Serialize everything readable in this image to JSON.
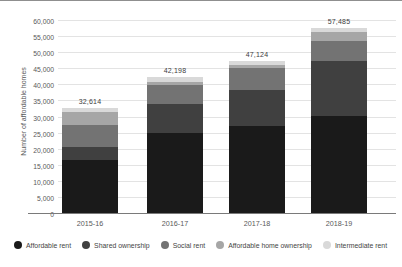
{
  "chart_data": {
    "type": "bar",
    "stacked": true,
    "title": "",
    "ylabel": "Number of affordable homes",
    "xlabel": "",
    "ylim": [
      0,
      60000
    ],
    "ytick_step": 5000,
    "ytick_labels": [
      "0",
      "5,000",
      "10,000",
      "15,000",
      "20,000",
      "25,000",
      "30,000",
      "35,000",
      "40,000",
      "45,000",
      "50,000",
      "55,000",
      "60,000"
    ],
    "grid": true,
    "legend_position": "bottom",
    "categories": [
      "2015-16",
      "2016-17",
      "2017-18",
      "2018-19"
    ],
    "series": [
      {
        "name": "Affordable rent",
        "color": "#1a1a1a",
        "values": [
          16550,
          24852,
          26984,
          30149
        ]
      },
      {
        "name": "Shared ownership",
        "color": "#404040",
        "values": [
          4084,
          9021,
          11307,
          17024
        ]
      },
      {
        "name": "Social rent",
        "color": "#737373",
        "values": [
          6798,
          5898,
          6679,
          6287
        ]
      },
      {
        "name": "Affordable home ownership",
        "color": "#a6a6a6",
        "values": [
          4072,
          1088,
          1110,
          2964
        ]
      },
      {
        "name": "Intermediate rent",
        "color": "#d9d9d9",
        "values": [
          1110,
          1339,
          1044,
          1061
        ]
      }
    ],
    "totals": [
      32614,
      42198,
      47124,
      57485
    ],
    "total_labels": [
      "32,614",
      "42,198",
      "47,124",
      "57,485"
    ]
  },
  "colors": {
    "background": "#ffffff",
    "gridline": "#e3e3e3",
    "axis_line": "#7a7a7a",
    "tick_text": "#595959",
    "total_text": "#404040",
    "top_border": "#8f8f8f"
  }
}
